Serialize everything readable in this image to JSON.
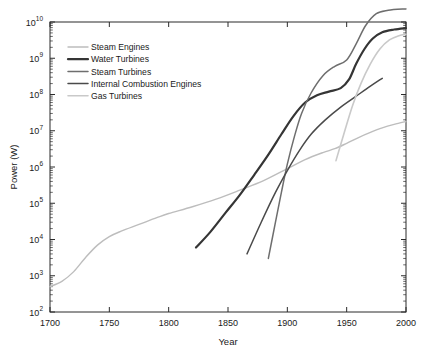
{
  "chart_data": {
    "type": "line",
    "title": "",
    "xlabel": "Year",
    "ylabel": "Power (W)",
    "xlim": [
      1700,
      2000
    ],
    "ylim": [
      100,
      10000000000
    ],
    "yscale": "log",
    "xscale": "linear",
    "grid": false,
    "legend_position": "upper-left-inside",
    "xticks": [
      1700,
      1750,
      1800,
      1850,
      1900,
      1950,
      2000
    ],
    "xticklabels": [
      "1700",
      "1750",
      "1800",
      "1850",
      "1900",
      "1950",
      "2000"
    ],
    "yticks": [
      100,
      1000,
      10000,
      100000,
      1000000,
      10000000,
      100000000,
      1000000000,
      10000000000
    ],
    "yticklabels": [
      "10²",
      "10³",
      "10⁴",
      "10⁵",
      "10⁶",
      "10⁷",
      "10⁸",
      "10⁹",
      "10¹⁰"
    ],
    "ytick_mantissa": "10",
    "ytick_exponents": [
      "2",
      "3",
      "4",
      "5",
      "6",
      "7",
      "8",
      "9",
      "10"
    ],
    "series": [
      {
        "name": "Steam Engines",
        "color": "#bdbdbd",
        "width": 1.4,
        "points": [
          [
            1700,
            500
          ],
          [
            1710,
            700
          ],
          [
            1720,
            1300
          ],
          [
            1730,
            3200
          ],
          [
            1740,
            7000
          ],
          [
            1750,
            12000
          ],
          [
            1760,
            17000
          ],
          [
            1775,
            26000
          ],
          [
            1790,
            40000
          ],
          [
            1800,
            52000
          ],
          [
            1820,
            80000
          ],
          [
            1840,
            130000
          ],
          [
            1860,
            230000
          ],
          [
            1880,
            420000
          ],
          [
            1900,
            900000
          ],
          [
            1915,
            1600000
          ],
          [
            1930,
            2500000
          ],
          [
            1940,
            3200000
          ],
          [
            1950,
            4500000
          ],
          [
            1960,
            6500000
          ],
          [
            1970,
            9000000
          ],
          [
            1980,
            12000000
          ],
          [
            1990,
            15000000
          ],
          [
            2000,
            18000000
          ]
        ]
      },
      {
        "name": "Water Turbines",
        "color": "#353535",
        "width": 2.2,
        "points": [
          [
            1823,
            6000
          ],
          [
            1835,
            16000
          ],
          [
            1848,
            55000
          ],
          [
            1860,
            170000
          ],
          [
            1872,
            600000
          ],
          [
            1884,
            2200000
          ],
          [
            1895,
            8000000
          ],
          [
            1905,
            25000000
          ],
          [
            1915,
            60000000
          ],
          [
            1925,
            95000000
          ],
          [
            1935,
            120000000
          ],
          [
            1945,
            150000000
          ],
          [
            1952,
            260000000
          ],
          [
            1958,
            700000000
          ],
          [
            1965,
            1800000000
          ],
          [
            1972,
            3500000000
          ],
          [
            1980,
            5200000000
          ],
          [
            1990,
            6200000000
          ],
          [
            2000,
            6800000000
          ]
        ]
      },
      {
        "name": "Steam Turbines",
        "color": "#6e6e6e",
        "width": 1.5,
        "points": [
          [
            1884,
            3000
          ],
          [
            1890,
            30000
          ],
          [
            1895,
            200000
          ],
          [
            1900,
            1200000
          ],
          [
            1906,
            7000000
          ],
          [
            1912,
            30000000
          ],
          [
            1920,
            110000000
          ],
          [
            1930,
            330000000
          ],
          [
            1940,
            600000000
          ],
          [
            1950,
            900000000
          ],
          [
            1958,
            2500000000
          ],
          [
            1966,
            8000000000
          ],
          [
            1975,
            17000000000
          ],
          [
            1985,
            21000000000
          ],
          [
            2000,
            23000000000
          ]
        ]
      },
      {
        "name": "Internal Combustion Engines",
        "color": "#4a4a4a",
        "width": 1.5,
        "points": [
          [
            1866,
            4000
          ],
          [
            1878,
            30000
          ],
          [
            1890,
            200000
          ],
          [
            1900,
            800000
          ],
          [
            1910,
            2800000
          ],
          [
            1920,
            8000000
          ],
          [
            1932,
            20000000
          ],
          [
            1945,
            45000000
          ],
          [
            1958,
            90000000
          ],
          [
            1970,
            170000000
          ],
          [
            1980,
            280000000
          ]
        ]
      },
      {
        "name": "Gas Turbines",
        "color": "#c9c9c9",
        "width": 1.6,
        "points": [
          [
            1941,
            1500000
          ],
          [
            1948,
            9000000
          ],
          [
            1955,
            50000000
          ],
          [
            1962,
            200000000
          ],
          [
            1970,
            700000000
          ],
          [
            1978,
            1800000000
          ],
          [
            1986,
            3200000000
          ],
          [
            1994,
            4200000000
          ],
          [
            2000,
            4600000000
          ]
        ]
      }
    ]
  },
  "legend": {
    "entries": [
      {
        "label": "Steam Engines"
      },
      {
        "label": "Water Turbines"
      },
      {
        "label": "Steam Turbines"
      },
      {
        "label": "Internal Combustion Engines"
      },
      {
        "label": "Gas Turbines"
      }
    ]
  }
}
